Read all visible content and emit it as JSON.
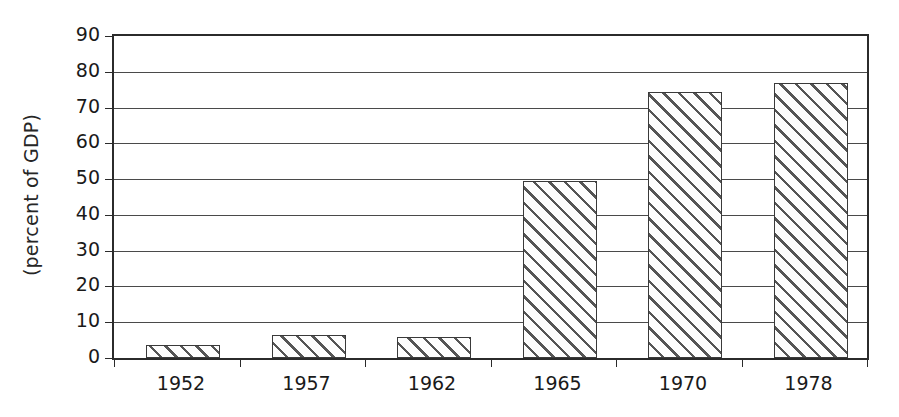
{
  "chart_data": {
    "type": "bar",
    "title": "",
    "subtitle": "",
    "xlabel": "",
    "ylabel": "(percent of GDP)",
    "categories": [
      "1952",
      "1957",
      "1962",
      "1965",
      "1970",
      "1978"
    ],
    "values": [
      3.6,
      6.3,
      6.0,
      49.5,
      74.3,
      77.0
    ],
    "series": [
      {
        "name": "",
        "values": [
          3.6,
          6.3,
          6.0,
          49.5,
          74.3,
          77.0
        ]
      }
    ],
    "ylim": [
      0,
      90
    ],
    "ytick_values": [
      0,
      10,
      20,
      30,
      40,
      50,
      60,
      70,
      80,
      90
    ],
    "ytick_labels": [
      "0",
      "10",
      "20",
      "30",
      "40",
      "50",
      "60",
      "70",
      "80",
      "90"
    ],
    "grid": true,
    "grid_axis": "y",
    "legend": false,
    "legend_position": "none",
    "annotations": [],
    "bar_fill": "diagonal-hatch",
    "bar_edge_color": "#3a3a3a",
    "bar_face_color": "#fdfdfd",
    "hatch_color": "#555555",
    "axis_color": "#2b2b2b",
    "grid_color": "#4a4a4a",
    "background_color": "#ffffff"
  }
}
